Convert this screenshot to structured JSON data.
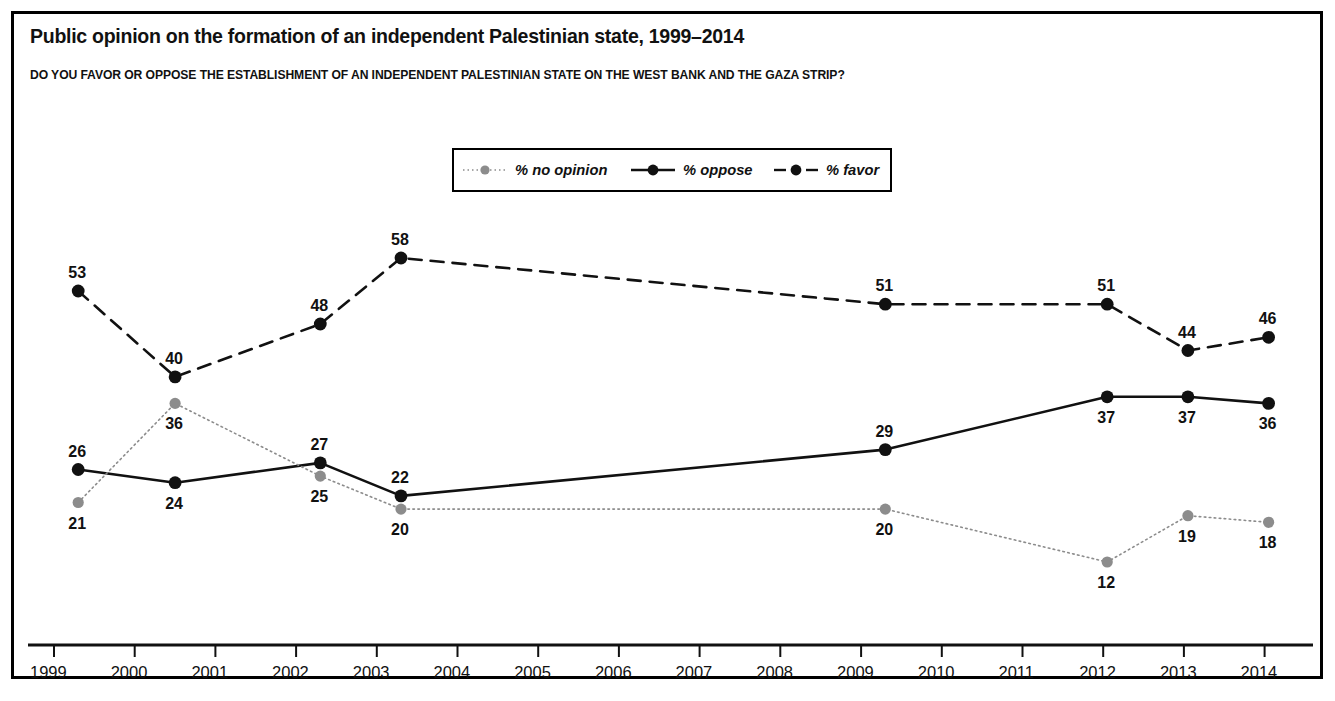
{
  "header": {
    "title": "Public opinion on the formation of an independent Palestinian state, 1999–2014",
    "subtitle": "DO YOU FAVOR OR OPPOSE THE ESTABLISHMENT OF AN INDEPENDENT PALESTINIAN STATE ON THE WEST BANK AND THE GAZA STRIP?"
  },
  "legend": {
    "position": "top-center",
    "items": [
      {
        "label": "% no opinion",
        "color": "#8c8c8c",
        "style": "dotted",
        "marker": "circle"
      },
      {
        "label": "% oppose",
        "color": "#111111",
        "style": "solid",
        "marker": "circle"
      },
      {
        "label": "% favor",
        "color": "#111111",
        "style": "dashed",
        "marker": "circle"
      }
    ]
  },
  "chart_data": {
    "type": "line",
    "title": "Public opinion on the formation of an independent Palestinian state, 1999–2014",
    "subtitle": "DO YOU FAVOR OR OPPOSE THE ESTABLISHMENT OF AN INDEPENDENT PALESTINIAN STATE ON THE WEST BANK AND THE GAZA STRIP?",
    "xlabel": "",
    "ylabel": "",
    "grid": false,
    "axis": {
      "x_ticks": [
        "1999",
        "2000",
        "2001",
        "2002",
        "2003",
        "2004",
        "2005",
        "2006",
        "2007",
        "2008",
        "2009",
        "2010",
        "2011",
        "2012",
        "2013",
        "2014"
      ],
      "x_range": [
        1999,
        2014.6
      ],
      "y_range": [
        5,
        62
      ],
      "y_axis_visible": false
    },
    "x": [
      1999.3,
      2000.5,
      2002.3,
      2003.3,
      2009.3,
      2012.05,
      2013.05,
      2014.05
    ],
    "series": [
      {
        "name": "% favor",
        "color": "#111111",
        "style": "dashed",
        "values": [
          53,
          40,
          48,
          58,
          51,
          51,
          44,
          46
        ],
        "label_positions": [
          "above",
          "above",
          "above",
          "above",
          "above",
          "above",
          "above",
          "above"
        ]
      },
      {
        "name": "% oppose",
        "color": "#111111",
        "style": "solid",
        "values": [
          26,
          24,
          27,
          22,
          29,
          37,
          37,
          36
        ],
        "label_positions": [
          "above",
          "below",
          "above",
          "above",
          "above",
          "below",
          "below",
          "below"
        ]
      },
      {
        "name": "% no opinion",
        "color": "#8c8c8c",
        "style": "dotted",
        "values": [
          21,
          36,
          25,
          20,
          20,
          12,
          19,
          18
        ],
        "label_positions": [
          "below",
          "below",
          "below",
          "below",
          "below",
          "below",
          "below",
          "below"
        ]
      }
    ]
  }
}
